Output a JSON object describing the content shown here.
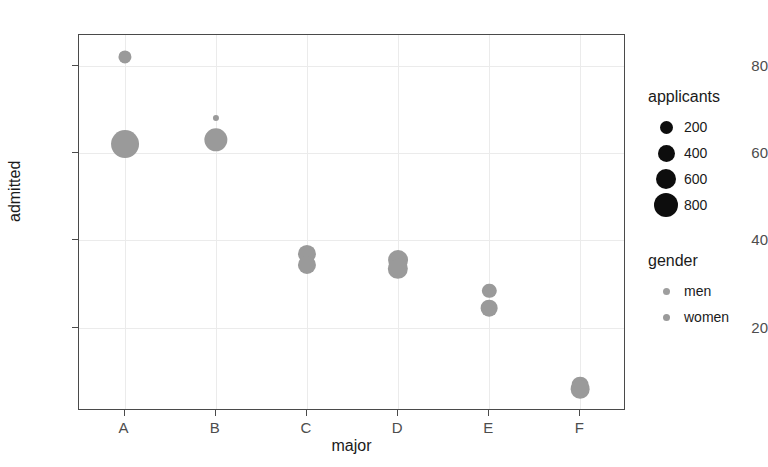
{
  "chart_data": {
    "type": "scatter",
    "title": "",
    "xlabel": "major",
    "ylabel": "admitted",
    "categories": [
      "A",
      "B",
      "C",
      "D",
      "E",
      "F"
    ],
    "xtick_labels": [
      "A",
      "B",
      "C",
      "D",
      "E",
      "F"
    ],
    "ytick_labels": [
      "20",
      "40",
      "60",
      "80"
    ],
    "ytick_values": [
      20,
      40,
      60,
      80
    ],
    "ylim": [
      1,
      87
    ],
    "grid": true,
    "legend_position": "right",
    "size_encoding": "applicants",
    "color_encoding": "gender",
    "series": [
      {
        "name": "men",
        "color": "#9a9a9a",
        "points": [
          {
            "major": "A",
            "admitted": 82.0,
            "applicants": 160
          },
          {
            "major": "B",
            "admitted": 68.0,
            "applicants": 25
          },
          {
            "major": "C",
            "admitted": 37.0,
            "applicants": 325
          },
          {
            "major": "D",
            "admitted": 35.5,
            "applicants": 400
          },
          {
            "major": "E",
            "admitted": 28.5,
            "applicants": 195
          },
          {
            "major": "F",
            "admitted": 7.0,
            "applicants": 275
          }
        ]
      },
      {
        "name": "women",
        "color": "#9a9a9a",
        "points": [
          {
            "major": "A",
            "admitted": 62.0,
            "applicants": 825
          },
          {
            "major": "B",
            "admitted": 63.0,
            "applicants": 560
          },
          {
            "major": "C",
            "admitted": 34.5,
            "applicants": 325
          },
          {
            "major": "D",
            "admitted": 33.5,
            "applicants": 420
          },
          {
            "major": "E",
            "admitted": 24.5,
            "applicants": 275
          },
          {
            "major": "F",
            "admitted": 6.0,
            "applicants": 350
          }
        ]
      }
    ]
  },
  "legends": {
    "size": {
      "title": "applicants",
      "entries": [
        {
          "label": "200",
          "diameter": 13
        },
        {
          "label": "400",
          "diameter": 17
        },
        {
          "label": "600",
          "diameter": 20
        },
        {
          "label": "800",
          "diameter": 24
        }
      ],
      "key_color": "#0d0d0d"
    },
    "color": {
      "title": "gender",
      "entries": [
        {
          "label": "men",
          "color": "#9e9e9e",
          "diameter": 7
        },
        {
          "label": "women",
          "color": "#9a9a9a",
          "diameter": 7
        }
      ]
    }
  }
}
